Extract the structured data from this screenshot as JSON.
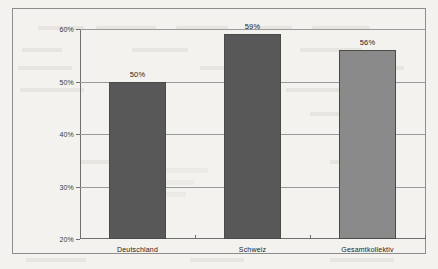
{
  "chart_data": {
    "type": "bar",
    "title": "",
    "subtitle": "",
    "xlabel": "",
    "ylabel": "",
    "categories": [
      "Deutschland",
      "Schweiz",
      "Gesamtkollektiv"
    ],
    "values": [
      50,
      59,
      56
    ],
    "value_labels": [
      "50%",
      "59%",
      "56%"
    ],
    "bar_colors": [
      "#585858",
      "#585858",
      "#8a8a8a"
    ],
    "ylim": [
      20,
      60
    ],
    "y_ticks": [
      20,
      30,
      40,
      50,
      60
    ],
    "y_tick_labels": [
      "20%",
      "30%",
      "40%",
      "50%",
      "60%"
    ],
    "grid": true,
    "grid_axis": "y",
    "legend": false,
    "legend_position": "none"
  },
  "figure": {
    "background_color": "#f3f2ef",
    "border_color": "#8d8d8d",
    "axis_color": "#6f6f6f",
    "gridline_color": "#9a9a9a",
    "text_color": "#1c1c1c"
  }
}
